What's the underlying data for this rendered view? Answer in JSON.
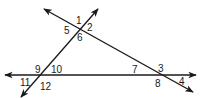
{
  "diagram": {
    "stroke_color": "#1a1a1a",
    "background": "#ffffff",
    "lines": [
      {
        "name": "horizontal-line",
        "x1": 5,
        "y1": 75,
        "x2": 196,
        "y2": 75,
        "arrows": "both"
      },
      {
        "name": "rising-transversal",
        "x1": 21,
        "y1": 97,
        "x2": 98,
        "y2": 9,
        "arrows": "both"
      },
      {
        "name": "falling-transversal",
        "x1": 44,
        "y1": 9,
        "x2": 193,
        "y2": 92,
        "arrows": "both"
      }
    ],
    "intersections": [
      {
        "name": "top-vertex",
        "x": 79,
        "y": 30,
        "angles": [
          "1",
          "2",
          "5",
          "6"
        ]
      },
      {
        "name": "left-vertex",
        "x": 40,
        "y": 75,
        "angles": [
          "9",
          "10",
          "11",
          "12"
        ]
      },
      {
        "name": "right-vertex",
        "x": 159,
        "y": 75,
        "angles": [
          "7",
          "3",
          "8",
          "4"
        ]
      }
    ],
    "angle_labels": [
      {
        "text": "1",
        "x": 76,
        "y": 24
      },
      {
        "text": "2",
        "x": 87,
        "y": 31
      },
      {
        "text": "5",
        "x": 64,
        "y": 34
      },
      {
        "text": "6",
        "x": 77,
        "y": 41
      },
      {
        "text": "9",
        "x": 35,
        "y": 73
      },
      {
        "text": "10",
        "x": 51,
        "y": 73
      },
      {
        "text": "11",
        "x": 20,
        "y": 86
      },
      {
        "text": "12",
        "x": 40,
        "y": 90
      },
      {
        "text": "7",
        "x": 132,
        "y": 73
      },
      {
        "text": "3",
        "x": 158,
        "y": 72
      },
      {
        "text": "8",
        "x": 155,
        "y": 87
      },
      {
        "text": "4",
        "x": 179,
        "y": 85
      }
    ]
  }
}
